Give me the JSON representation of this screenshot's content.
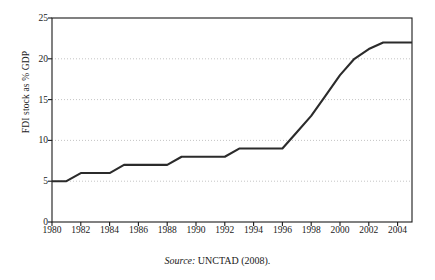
{
  "chart_data": {
    "type": "line",
    "title": "",
    "subtitle": "",
    "xlabel": "",
    "ylabel": "FDI stock as % GDP",
    "xlim": [
      1980,
      2005
    ],
    "ylim": [
      0,
      25
    ],
    "xticks": [
      1980,
      1982,
      1984,
      1986,
      1988,
      1990,
      1992,
      1994,
      1996,
      1998,
      2000,
      2002,
      2004
    ],
    "xtick_labels": [
      "1980",
      "1982",
      "1984",
      "1986",
      "1988",
      "1990",
      "1992",
      "1994",
      "1996",
      "1998",
      "2000",
      "2002",
      "2004"
    ],
    "yticks": [
      0,
      5,
      10,
      15,
      20,
      25
    ],
    "ytick_labels": [
      "0",
      "5",
      "10",
      "15",
      "20",
      "25"
    ],
    "grid": "horizontal-dotted",
    "legend": "none",
    "series": [
      {
        "name": "FDI stock as % GDP",
        "color": "#2b2b2b",
        "x": [
          1980,
          1981,
          1982,
          1983,
          1984,
          1985,
          1986,
          1987,
          1988,
          1989,
          1990,
          1991,
          1992,
          1993,
          1994,
          1995,
          1996,
          1997,
          1998,
          1999,
          2000,
          2001,
          2002,
          2003,
          2004,
          2005
        ],
        "values": [
          5,
          5,
          6,
          6,
          6,
          7,
          7,
          7,
          7,
          8,
          8,
          8,
          8,
          9,
          9,
          9,
          9,
          11,
          13,
          15.5,
          18,
          20,
          21.2,
          22,
          22,
          22
        ]
      }
    ],
    "annotations": []
  },
  "source": {
    "label": "Source:",
    "value": " UNCTAD (2008)."
  },
  "colors": {
    "line": "#2b2b2b",
    "axis": "#1a1a1a",
    "grid": "#b5b5b5",
    "background": "#ffffff"
  }
}
